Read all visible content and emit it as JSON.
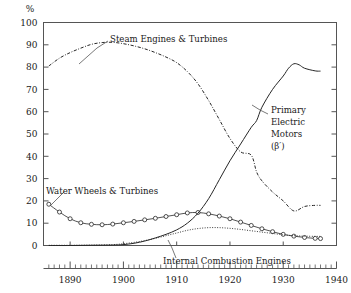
{
  "chart_data": {
    "type": "line",
    "title": "",
    "xlabel": "",
    "ylabel": "%",
    "ylim": [
      0,
      100
    ],
    "xlim": [
      1885,
      1940
    ],
    "yticks": [
      0,
      10,
      20,
      30,
      40,
      50,
      60,
      70,
      80,
      90,
      100
    ],
    "ytick_labels": [
      "0",
      "10",
      "20",
      "30",
      "40",
      "50",
      "60",
      "70",
      "80",
      "90",
      "100"
    ],
    "xticks": [
      1890,
      1900,
      1910,
      1920,
      1930,
      1940
    ],
    "xtick_labels": [
      "1890",
      "1900",
      "1910",
      "1920",
      "1930",
      "1940"
    ],
    "grid": false,
    "legend_position": "inline-annotations",
    "series": [
      {
        "name": "Steam Engines & Turbines",
        "marker": "dot-dash",
        "x": [
          1886,
          1888,
          1890,
          1892,
          1894,
          1896,
          1898,
          1900,
          1902,
          1904,
          1906,
          1908,
          1910,
          1912,
          1914,
          1916,
          1918,
          1920,
          1922,
          1924,
          1925,
          1926,
          1928,
          1930,
          1932,
          1934,
          1936,
          1937
        ],
        "values": [
          80.5,
          84.0,
          86.5,
          88.5,
          90.2,
          91.0,
          91.1,
          90.5,
          89.5,
          88.2,
          86.5,
          84.5,
          82.0,
          78.0,
          72.5,
          65.0,
          56.5,
          48.0,
          42.0,
          40.5,
          33.0,
          29.0,
          24.0,
          20.0,
          15.5,
          17.5,
          18.0,
          18.0
        ]
      },
      {
        "name": "Water Wheels & Turbines",
        "marker": "open-circle",
        "x": [
          1886,
          1888,
          1890,
          1892,
          1894,
          1896,
          1898,
          1900,
          1902,
          1904,
          1906,
          1908,
          1910,
          1912,
          1914,
          1916,
          1918,
          1920,
          1922,
          1924,
          1926,
          1928,
          1930,
          1932,
          1934,
          1936,
          1937
        ],
        "values": [
          18.5,
          15.0,
          12.0,
          10.2,
          9.5,
          9.3,
          9.6,
          10.2,
          10.8,
          11.5,
          12.2,
          13.0,
          13.8,
          14.6,
          14.8,
          14.2,
          13.2,
          12.0,
          10.5,
          9.0,
          7.5,
          6.2,
          5.0,
          4.2,
          3.6,
          3.2,
          3.1
        ]
      },
      {
        "name": "Internal Combustion Engines",
        "marker": "dotted",
        "x": [
          1886,
          1890,
          1894,
          1898,
          1900,
          1902,
          1904,
          1906,
          1908,
          1910,
          1912,
          1914,
          1916,
          1918,
          1920,
          1922,
          1924,
          1926,
          1928,
          1930,
          1932,
          1934,
          1936,
          1937
        ],
        "values": [
          0.1,
          0.1,
          0.2,
          0.4,
          0.8,
          1.4,
          2.2,
          3.2,
          4.4,
          5.6,
          6.8,
          7.6,
          8.0,
          8.0,
          7.7,
          7.2,
          6.6,
          6.0,
          5.4,
          4.8,
          4.4,
          4.2,
          4.1,
          4.1
        ]
      },
      {
        "name": "Primary Electric Motors",
        "marker": "solid",
        "x": [
          1886,
          1890,
          1894,
          1898,
          1900,
          1902,
          1904,
          1906,
          1908,
          1910,
          1912,
          1914,
          1916,
          1918,
          1920,
          1922,
          1924,
          1925,
          1926,
          1928,
          1930,
          1931,
          1932,
          1933,
          1934,
          1936,
          1937
        ],
        "values": [
          0.0,
          0.0,
          0.1,
          0.2,
          0.4,
          1.0,
          2.0,
          3.4,
          5.0,
          7.0,
          10.0,
          14.5,
          21.0,
          29.5,
          38.0,
          45.5,
          53.0,
          56.0,
          62.0,
          70.0,
          76.0,
          79.5,
          81.5,
          81.0,
          79.5,
          78.3,
          78.2
        ]
      }
    ],
    "annotations": [
      {
        "id": "steam-engines-label",
        "text": "Steam Engines & Turbines",
        "x_px": 110,
        "y_px": 42
      },
      {
        "id": "water-wheels-label",
        "text": "Water Wheels & Turbines",
        "x_px": 46,
        "y_px": 194
      },
      {
        "id": "internal-combustion-label",
        "text": "Internal Combustion Engines",
        "x_px": 163,
        "y_px": 264
      },
      {
        "id": "primary-electric-motors-label",
        "line1": "Primary",
        "line2": "Electric",
        "line3": "Motors",
        "line4": "(β′)",
        "x_px": 271,
        "y_px": 113
      }
    ],
    "colors": {
      "axis": "#555555",
      "line": "#262626",
      "text": "#1a1a1a",
      "background": "#ffffff"
    }
  }
}
